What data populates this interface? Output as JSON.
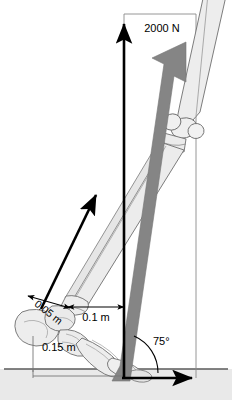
{
  "figure": {
    "type": "biomechanics-free-body-diagram",
    "canvas": {
      "width": 232,
      "height": 400
    },
    "background_color": "#ffffff"
  },
  "labels": {
    "force_magnitude": "2000 N",
    "dim_achilles": "0.05 m",
    "dim_horizontal": "0.1 m",
    "dim_ground": "0.15 m",
    "angle": "75°"
  },
  "colors": {
    "ground_band": "#e8e8e8",
    "ground_line": "#555555",
    "bone_fill": "#eeeeee",
    "bone_stroke": "#666666",
    "muscle_fill": "#dcdcdc",
    "muscle_stroke": "#9a9a9a",
    "force_arrow_grey": "#808080",
    "vector_black": "#000000",
    "frame_line": "#7a7a7a"
  },
  "vectors": [
    {
      "name": "ground-reaction-vertical",
      "label": "2000 N",
      "color": "#000000",
      "direction": "up",
      "from": [
        124,
        378
      ],
      "to": [
        124,
        21
      ]
    },
    {
      "name": "achilles-tendon-force",
      "label": "",
      "color": "#000000",
      "direction": "up-right",
      "from": [
        42,
        308
      ],
      "to": [
        98,
        192
      ]
    },
    {
      "name": "horizontal-baseline-vector",
      "label": "",
      "color": "#000000",
      "direction": "right",
      "from": [
        122,
        378
      ],
      "to": [
        196,
        378
      ]
    },
    {
      "name": "leg-axial-load",
      "label": "2000 N",
      "color": "#808080",
      "direction": "up-right",
      "from": [
        122,
        380
      ],
      "to": [
        186,
        42
      ]
    }
  ],
  "dimensions": [
    {
      "name": "achilles-moment-arm",
      "label": "0.05 m",
      "orientation": "diagonal",
      "rotation_deg": 38
    },
    {
      "name": "horizontal-moment-arm",
      "label": "0.1 m",
      "orientation": "horizontal",
      "from": [
        68,
        307
      ],
      "to": [
        124,
        307
      ]
    },
    {
      "name": "ground-offset",
      "label": "0.15 m",
      "orientation": "horizontal",
      "from": [
        33,
        369
      ],
      "to": [
        124,
        369
      ]
    }
  ],
  "angle_marker": {
    "name": "load-angle",
    "label": "75°",
    "value_deg": 75,
    "vertex": [
      124,
      378
    ]
  },
  "anatomy": [
    {
      "name": "femur",
      "description": "upper leg bone entering from top right"
    },
    {
      "name": "patella",
      "description": "kneecap oval at knee joint"
    },
    {
      "name": "knee-joint",
      "description": "condyle articulation"
    },
    {
      "name": "tibia",
      "description": "main lower leg bone running diagonally"
    },
    {
      "name": "fibula",
      "description": "slender lateral lower leg bone"
    },
    {
      "name": "calcaneus",
      "description": "heel bone"
    },
    {
      "name": "tarsals",
      "description": "midfoot bones"
    },
    {
      "name": "metatarsals",
      "description": "forefoot bones toward toes"
    },
    {
      "name": "phalanges",
      "description": "toe bones at ground contact"
    }
  ]
}
